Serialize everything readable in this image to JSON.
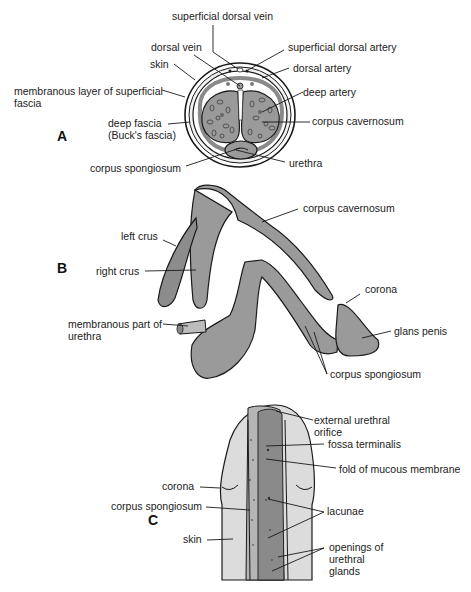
{
  "figure": {
    "panels": [
      {
        "id": "A",
        "letter": "A",
        "title": "Cross-section of penis",
        "labels": {
          "superficial_dorsal_vein": "superficial dorsal vein",
          "dorsal_vein": "dorsal vein",
          "superficial_dorsal_artery": "superficial dorsal artery",
          "skin": "skin",
          "dorsal_artery": "dorsal artery",
          "membranous_layer_1": "membranous layer of superficial",
          "membranous_layer_2": "fascia",
          "deep_artery": "deep artery",
          "corpus_cavernosum": "corpus cavernosum",
          "deep_fascia_1": "deep fascia",
          "deep_fascia_2": "(Buck's fascia)",
          "urethra": "urethra",
          "corpus_spongiosum": "corpus spongiosum"
        }
      },
      {
        "id": "B",
        "letter": "B",
        "title": "Erectile tissue components",
        "labels": {
          "corpus_cavernosum": "corpus cavernosum",
          "left_crus": "left crus",
          "right_crus": "right crus",
          "corona": "corona",
          "membranous_urethra_1": "membranous part of",
          "membranous_urethra_2": "urethra",
          "glans_penis": "glans penis",
          "corpus_spongiosum": "corpus spongiosum"
        }
      },
      {
        "id": "C",
        "letter": "C",
        "title": "Urethra opened in glans",
        "labels": {
          "external_urethral_orifice_1": "external urethral",
          "external_urethral_orifice_2": "orifice",
          "fossa_terminalis": "fossa terminalis",
          "fold_mucous_membrane": "fold of mucous membrane",
          "corona": "corona",
          "corpus_spongiosum": "corpus spongiosum",
          "lacunae": "lacunae",
          "skin": "skin",
          "openings_1": "openings of",
          "openings_2": "urethral",
          "openings_3": "glands"
        }
      }
    ],
    "colors": {
      "tissue_gray": "#9a9a9a",
      "tissue_dark": "#7c7c7c",
      "skin_light": "#d9d9d9",
      "line": "#1a1a1a"
    }
  }
}
